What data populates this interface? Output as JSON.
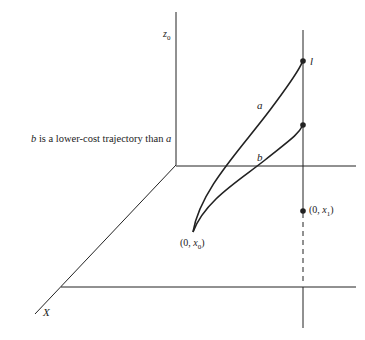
{
  "diagram": {
    "caption": {
      "b": "b",
      "text": " is a lower-cost trajectory than ",
      "a": "a"
    },
    "axes": {
      "z_label": "z",
      "z_sub": "0",
      "x_label": "X"
    },
    "curves": [
      {
        "name": "a",
        "label": "a"
      },
      {
        "name": "b",
        "label": "b"
      }
    ],
    "points": {
      "l": "l",
      "start": {
        "open": "(0, ",
        "var": "x",
        "sub": "0",
        "close": ")"
      },
      "target": {
        "open": "(0, ",
        "var": "x",
        "sub": "1",
        "close": ")"
      }
    },
    "colors": {
      "ink": "#222222",
      "background": "#ffffff"
    }
  }
}
